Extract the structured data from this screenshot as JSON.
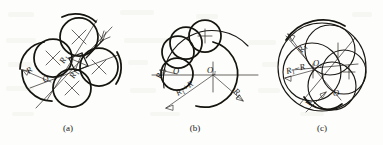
{
  "plate": {
    "title": "Tangent circle construction figures",
    "background_color": "#fdfdfb",
    "ink_color": "#15140f"
  },
  "figures": [
    {
      "id": "a",
      "caption": "(a)",
      "caption_x": 68,
      "caption_y": 131,
      "description": "Four equal circles of radius R arranged around a common centre O with crossed centre-lines and external arcs",
      "labels": [
        {
          "name": "radius-R-outer",
          "text": "R",
          "sub": "",
          "x": 29,
          "y": 74,
          "rotate": -40
        },
        {
          "name": "center-O",
          "text": "O",
          "sub": "",
          "x": 45,
          "y": 83,
          "rotate": -40
        },
        {
          "name": "radius-R-inner-upper",
          "text": "R",
          "sub": "1",
          "x": 64,
          "y": 64,
          "rotate": -62
        },
        {
          "name": "radius-R-inner-lower",
          "text": "R",
          "sub": "1",
          "x": 74,
          "y": 79,
          "rotate": -62
        }
      ]
    },
    {
      "id": "b",
      "caption": "(b)",
      "caption_x": 195,
      "caption_y": 131,
      "description": "External tangency: small circle radius R rolling outside large circle radius R1, centre distance R1 plus R",
      "labels": [
        {
          "name": "radius-R",
          "text": "R",
          "sub": "",
          "x": 161,
          "y": 79,
          "rotate": -72
        },
        {
          "name": "center-O",
          "text": "O",
          "sub": "",
          "x": 175,
          "y": 74,
          "rotate": 0
        },
        {
          "name": "center-O1",
          "text": "O",
          "sub": "1",
          "x": 211,
          "y": 73,
          "rotate": 0
        },
        {
          "name": "sum-R1-plus-R",
          "text": "R",
          "sub": "1",
          "suffix": "+R",
          "x": 178,
          "y": 96,
          "rotate": 42
        },
        {
          "name": "radius-R1",
          "text": "R",
          "sub": "1",
          "x": 233,
          "y": 92,
          "rotate": 45
        }
      ]
    },
    {
      "id": "c",
      "caption": "(c)",
      "caption_x": 322,
      "caption_y": 131,
      "description": "Internal tangency: circles radius R inside large circle radius R1, centre distance R1 minus R",
      "labels": [
        {
          "name": "radius-R1",
          "text": "R",
          "sub": "1",
          "x": 302,
          "y": 53,
          "rotate": -58
        },
        {
          "name": "difference-R1-minus-R",
          "text": "R",
          "sub": "1",
          "suffix": "−R",
          "x": 289,
          "y": 72,
          "rotate": -20
        },
        {
          "name": "center-O1",
          "text": "O",
          "sub": "1",
          "x": 316,
          "y": 65,
          "rotate": 0
        },
        {
          "name": "center-O",
          "text": "O",
          "sub": "",
          "x": 334,
          "y": 96,
          "rotate": 0
        },
        {
          "name": "radius-R",
          "text": "R",
          "sub": "",
          "x": 310,
          "y": 106,
          "rotate": -66
        }
      ]
    }
  ]
}
